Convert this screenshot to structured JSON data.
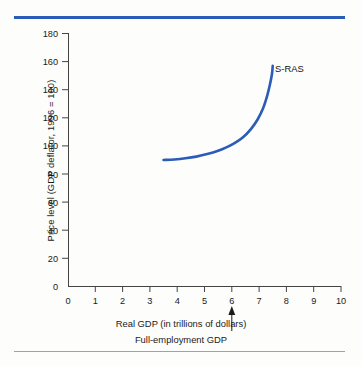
{
  "figure": {
    "series_label": "S-RAS",
    "xlabel": "Real GDP (in trillions of dollars)",
    "sublabel": "Full-employment GDP",
    "ylabel": "Price level (GDP deflator, 1996 = 100)",
    "accent_color": "#2a5cb8",
    "curve_color": "#2a5cb8"
  },
  "chart_data": {
    "type": "line",
    "title": "",
    "xlabel": "Real GDP (in trillions of dollars)",
    "ylabel": "Price level (GDP deflator, 1996 = 100)",
    "xlim": [
      0,
      10
    ],
    "ylim": [
      0,
      180
    ],
    "xticks": [
      0,
      1,
      2,
      3,
      4,
      5,
      6,
      7,
      8,
      9,
      10
    ],
    "yticks": [
      0,
      20,
      40,
      60,
      80,
      100,
      120,
      140,
      160,
      180
    ],
    "xtick_labels": [
      "0",
      "1",
      "2",
      "3",
      "4",
      "5",
      "6",
      "7",
      "8",
      "9",
      "10"
    ],
    "ytick_labels": [
      "0",
      "20",
      "40",
      "60",
      "80",
      "100",
      "120",
      "140",
      "160",
      "180"
    ],
    "grid": false,
    "legend": "none",
    "series": [
      {
        "name": "S-RAS",
        "label_position": {
          "x": 7.8,
          "y": 152
        },
        "x": [
          3.5,
          3.9,
          4.3,
          4.7,
          5.1,
          5.5,
          5.8,
          6.1,
          6.4,
          6.7,
          6.95,
          7.15,
          7.3,
          7.4,
          7.47,
          7.5
        ],
        "y": [
          90,
          90.4,
          91.2,
          92.4,
          94.2,
          96.6,
          99.0,
          102.0,
          106.0,
          112.0,
          119.0,
          127.0,
          136.0,
          144.0,
          151.0,
          157
        ]
      }
    ],
    "annotations": [
      {
        "type": "arrow",
        "label": "Full-employment GDP",
        "x": 6,
        "y": 0,
        "direction": "up"
      }
    ]
  }
}
